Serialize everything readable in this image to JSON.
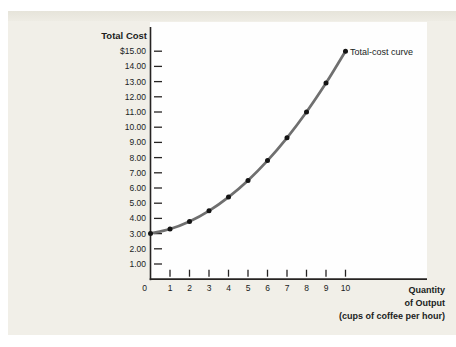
{
  "figure": {
    "y_axis_title": "Total Cost",
    "curve_label": "Total-cost curve",
    "x_axis_title_lines": [
      "Quantity",
      "of Output",
      "(cups of coffee per hour)"
    ]
  },
  "colors": {
    "panel": "#f1efe8",
    "panel_top_edge": "#e6e4da",
    "plot_background": "#fefefe",
    "axis": "#262322",
    "tick": "#262322",
    "curve": "#6f6f6f",
    "point": "#141414",
    "text": "#201d1d",
    "shadow": "#d3d2ce"
  },
  "chart_data": {
    "type": "line",
    "title": "Total Cost",
    "xlabel": "Quantity of Output (cups of coffee per hour)",
    "ylabel": "Total Cost",
    "x": [
      0,
      1,
      2,
      3,
      4,
      5,
      6,
      7,
      8,
      9,
      10
    ],
    "series": [
      {
        "name": "Total-cost curve",
        "values": [
          3.0,
          3.3,
          3.8,
          4.5,
          5.4,
          6.5,
          7.8,
          9.3,
          11.0,
          12.9,
          15.0
        ]
      }
    ],
    "xlim": [
      0,
      10
    ],
    "ylim": [
      0,
      15
    ],
    "x_ticks": [
      0,
      1,
      2,
      3,
      4,
      5,
      6,
      7,
      8,
      9,
      10
    ],
    "x_tick_labels": [
      "0",
      "1",
      "2",
      "3",
      "4",
      "5",
      "6",
      "7",
      "8",
      "9",
      "10"
    ],
    "y_ticks": [
      1,
      2,
      3,
      4,
      5,
      6,
      7,
      8,
      9,
      10,
      11,
      12,
      13,
      14,
      15
    ],
    "y_tick_labels": [
      "1.00",
      "2.00",
      "3.00",
      "4.00",
      "5.00",
      "6.00",
      "7.00",
      "8.00",
      "9.00",
      "10.00",
      "11.00",
      "12.00",
      "13.00",
      "14.00",
      "$15.00"
    ],
    "grid": false,
    "legend": "inline-annotation-at-last-point",
    "markers": "filled-circle-every-point"
  }
}
